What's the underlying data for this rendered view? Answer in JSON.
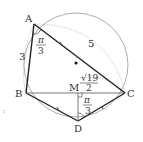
{
  "diagram": {
    "type": "geometry",
    "points": {
      "A": {
        "label": "A",
        "x": 34,
        "y": 24
      },
      "B": {
        "label": "B",
        "x": 26,
        "y": 93
      },
      "C": {
        "label": "C",
        "x": 125,
        "y": 93
      },
      "D": {
        "label": "D",
        "x": 78,
        "y": 121
      },
      "M": {
        "label": "M",
        "x": 78,
        "y": 93
      },
      "O": {
        "x": 76,
        "y": 63
      }
    },
    "circle": {
      "cx": 76,
      "cy": 65,
      "r": 52
    },
    "labels": {
      "AB": "3",
      "AC": "5",
      "angle_A_num": "π",
      "angle_A_den": "3",
      "MC_num": "√19",
      "MC_den": "2",
      "angle_D_num": "π",
      "angle_D_den": "3"
    },
    "colors": {
      "line": "#333333",
      "circle": "#888888",
      "dotted": "#999999"
    }
  }
}
